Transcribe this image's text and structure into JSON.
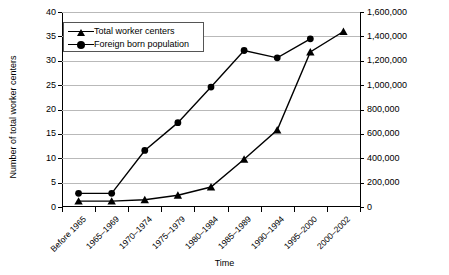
{
  "chart_data": {
    "type": "line",
    "title": "",
    "xlabel": "Time",
    "ylabel": "Number of total worker centers",
    "ylabel_right": "Foreign born population",
    "categories": [
      "Before 1965",
      "1965–1969",
      "1970–1974",
      "1975–1979",
      "1980–1984",
      "1985–1989",
      "1990–1994",
      "1995–2000",
      "2000–2002"
    ],
    "ylim": [
      0,
      40
    ],
    "yticks": [
      0,
      5,
      10,
      15,
      20,
      25,
      30,
      35,
      40
    ],
    "ytick_labels": [
      "0",
      "5",
      "10",
      "15",
      "20",
      "25",
      "30",
      "35",
      "40"
    ],
    "ylim_right": [
      0,
      1600000
    ],
    "yticks_right": [
      0,
      200000,
      400000,
      600000,
      800000,
      1000000,
      1200000,
      1400000,
      1600000
    ],
    "ytick_labels_right": [
      "0",
      "200,000",
      "400,000",
      "600,000",
      "800,000",
      "1,000,000",
      "1,200,000",
      "1,400,000",
      "1,600,000"
    ],
    "grid": true,
    "legend_position": "top-left",
    "series": [
      {
        "name": "Total worker centers",
        "marker": "triangle",
        "axis": "left",
        "values": [
          1.2,
          1.2,
          1.5,
          2.4,
          4.1,
          9.8,
          15.8,
          31.8,
          36.0
        ]
      },
      {
        "name": "Foreign born population",
        "marker": "circle",
        "axis": "right",
        "values": [
          110000,
          110000,
          460000,
          690000,
          980000,
          1285000,
          1225000,
          1380000,
          null
        ],
        "values_left_scale": [
          2.8,
          2.8,
          11.6,
          17.3,
          24.6,
          32.1,
          30.6,
          34.5,
          null
        ]
      }
    ]
  },
  "legend": {
    "items": [
      {
        "label": "Total worker centers",
        "marker": "triangle"
      },
      {
        "label": "Foreign born population",
        "marker": "circle"
      }
    ]
  }
}
